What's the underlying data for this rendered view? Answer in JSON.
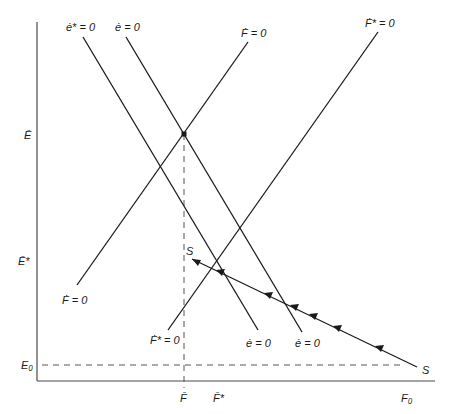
{
  "diagram": {
    "type": "phase-diagram",
    "colors": {
      "line": "#1a1a1a",
      "axis": "#4a4a4a",
      "dashed": "#555555",
      "background": "#ffffff"
    },
    "curve_labels": {
      "e_star_dot_top": "ė* = 0",
      "e_dot_top": "ė = 0",
      "F_dot_top": "Ḟ = 0",
      "F_star_dot_top": "Ḟ* = 0",
      "F_dot_bottom": "Ḟ = 0",
      "F_star_dot_bottom": "Ḟ* = 0",
      "e_dot_bottom_1": "ė = 0",
      "e_dot_bottom_2": "ė = 0"
    },
    "axis_labels": {
      "y_E_bar": "Ē",
      "y_E_bar_star": "Ē*",
      "y_E0": "E₀",
      "x_F_bar": "F̄",
      "x_F_bar_star": "F̄*",
      "x_F0": "F₀"
    },
    "saddle_labels": {
      "s_start": "S",
      "s_end": "S"
    }
  }
}
